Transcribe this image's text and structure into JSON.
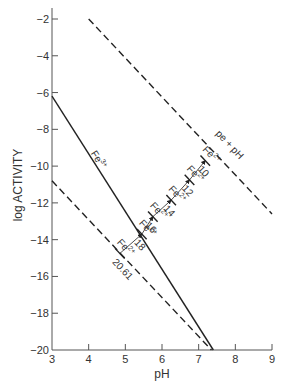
{
  "chart_data": {
    "type": "line",
    "title": "",
    "xlabel": "pH",
    "ylabel": "log ACTIVITY",
    "xlim": [
      3,
      9
    ],
    "ylim": [
      -20,
      -2
    ],
    "xticks": [
      3,
      4,
      5,
      6,
      7,
      8,
      9
    ],
    "yticks": [
      -2,
      -4,
      -6,
      -8,
      -10,
      -12,
      -14,
      -16,
      -18,
      -20
    ],
    "grid": false,
    "legend": null,
    "series": [
      {
        "name": "Fe3+",
        "style": "solid",
        "x": [
          3.0,
          7.4
        ],
        "y": [
          -6.2,
          -20.0
        ],
        "label": "Fe3+",
        "label_pos": [
          4.05,
          -9.6
        ]
      },
      {
        "name": "pe + pH = 10 boundary (Fe2+)",
        "style": "dashed",
        "x": [
          4.0,
          9.0
        ],
        "y": [
          -2.0,
          -12.6
        ],
        "label": "pe + pH",
        "label_pos": [
          7.55,
          -8.8
        ]
      },
      {
        "name": "pe + pH = 20.61 boundary (Fe2+)",
        "style": "dashed",
        "x": [
          3.0,
          7.35
        ],
        "y": [
          -10.8,
          -20.0
        ],
        "label": "Fe2+",
        "label_pos": [
          4.6,
          -12.5
        ]
      }
    ],
    "staircase": {
      "description": "Fe2+ activity lines at successive pe + pH values (arrows)",
      "points": [
        {
          "value": "10",
          "pH": 7.18,
          "log": -9.7
        },
        {
          "value": "12",
          "pH": 6.75,
          "log": -10.75
        },
        {
          "value": "14",
          "pH": 6.25,
          "log": -11.85
        },
        {
          "value": "16",
          "pH": 5.75,
          "log": -12.75
        },
        {
          "value": "18",
          "pH": 5.45,
          "log": -13.7
        },
        {
          "value": "20.61",
          "pH": 4.85,
          "log": -14.75
        }
      ],
      "species_label": "Fe2+"
    },
    "annotations": [
      "Fe3+",
      "Fe2+",
      "pe + pH",
      "10",
      "12",
      "14",
      "16",
      "18",
      "20.61"
    ]
  },
  "labels": {
    "xlabel": "pH",
    "ylabel": "log ACTIVITY",
    "fe3": "Fe",
    "fe3_sup": "3+",
    "fe2": "Fe",
    "fe2_sup": "2+",
    "pepH": "pe + pH"
  },
  "colors": {
    "line": "#222222",
    "axis": "#555555",
    "text": "#333333"
  }
}
